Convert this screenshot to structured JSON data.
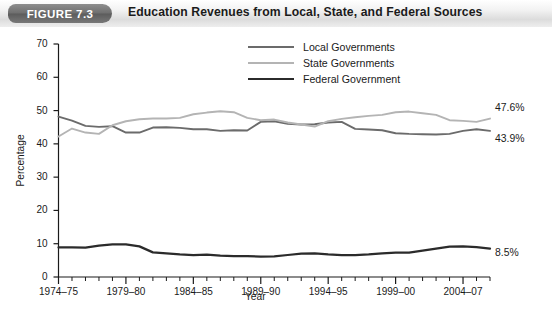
{
  "header": {
    "figure_tag": "FIGURE 7.3",
    "title": "Education Revenues from Local, State, and Federal Sources"
  },
  "legend": {
    "position": "top-center",
    "items": [
      {
        "label": "Local Governments",
        "color": "#6b6b6b",
        "width": 2.2
      },
      {
        "label": "State Governments",
        "color": "#b4b4b4",
        "width": 2.2
      },
      {
        "label": "Federal Government",
        "color": "#2b2b2b",
        "width": 2.6
      }
    ]
  },
  "axes": {
    "y_title": "Percentage",
    "x_title": "Year",
    "y_ticks": [
      "0",
      "10",
      "20",
      "30",
      "40",
      "50",
      "60",
      "70"
    ],
    "x_ticks": [
      "1974–75",
      "1979–80",
      "1984–85",
      "1989–90",
      "1994–95",
      "1999–00",
      "2004–07"
    ]
  },
  "end_labels": [
    {
      "text": "47.6%",
      "series": "State Governments"
    },
    {
      "text": "43.9%",
      "series": "Local Governments"
    },
    {
      "text": "8.5%",
      "series": "Federal Government"
    }
  ],
  "chart_data": {
    "type": "line",
    "title": "Education Revenues from Local, State, and Federal Sources",
    "xlabel": "Year",
    "ylabel": "Percentage",
    "ylim": [
      0,
      70
    ],
    "ytick_step": 10,
    "grid": false,
    "legend_position": "top-center",
    "x": [
      "1974–75",
      "1975–76",
      "1976–77",
      "1977–78",
      "1978–79",
      "1979–80",
      "1980–81",
      "1981–82",
      "1982–83",
      "1983–84",
      "1984–85",
      "1985–86",
      "1986–87",
      "1987–88",
      "1988–89",
      "1989–90",
      "1990–91",
      "1991–92",
      "1992–93",
      "1993–94",
      "1994–95",
      "1995–96",
      "1996–97",
      "1997–98",
      "1998–99",
      "1999–00",
      "2000–01",
      "2001–02",
      "2002–03",
      "2003–04",
      "2004–05",
      "2005–06",
      "2006–07"
    ],
    "series": [
      {
        "name": "Local Governments",
        "color": "#6b6b6b",
        "end_value": 43.9,
        "values": [
          48.2,
          47.0,
          45.4,
          45.1,
          45.3,
          43.4,
          43.4,
          44.9,
          45.0,
          44.8,
          44.4,
          44.4,
          43.9,
          44.1,
          44.0,
          46.6,
          46.8,
          46.0,
          45.8,
          45.9,
          46.4,
          46.6,
          44.5,
          44.3,
          44.1,
          43.2,
          43.0,
          42.9,
          42.8,
          43.0,
          43.9,
          44.4,
          43.9
        ]
      },
      {
        "name": "State Governments",
        "color": "#b4b4b4",
        "end_value": 47.6,
        "values": [
          42.2,
          44.6,
          43.4,
          43.0,
          45.6,
          46.8,
          47.4,
          47.6,
          47.6,
          47.8,
          48.9,
          49.4,
          49.8,
          49.5,
          47.8,
          47.1,
          47.3,
          46.4,
          45.8,
          45.2,
          46.8,
          47.5,
          48.0,
          48.4,
          48.7,
          49.5,
          49.7,
          49.2,
          48.7,
          47.1,
          46.9,
          46.6,
          47.6
        ]
      },
      {
        "name": "Federal Government",
        "color": "#2b2b2b",
        "end_value": 8.5,
        "values": [
          8.9,
          8.9,
          8.8,
          9.4,
          9.8,
          9.8,
          9.2,
          7.4,
          7.1,
          6.8,
          6.6,
          6.7,
          6.4,
          6.3,
          6.3,
          6.1,
          6.2,
          6.6,
          7.0,
          7.1,
          6.8,
          6.6,
          6.6,
          6.8,
          7.1,
          7.3,
          7.3,
          7.9,
          8.5,
          9.1,
          9.2,
          9.0,
          8.5
        ]
      }
    ]
  }
}
